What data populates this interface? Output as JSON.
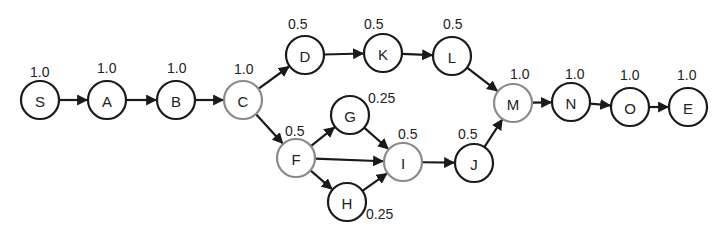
{
  "diagram": {
    "type": "directed-graph",
    "colors": {
      "node_stroke_default": "#1a1a1a",
      "node_stroke_highlight": "#8a8a8a",
      "edge": "#1a1a1a",
      "text": "#222222"
    },
    "nodes": [
      {
        "id": "S",
        "label": "S",
        "weight": "1.0",
        "x": 40,
        "y": 100,
        "highlight": false,
        "wx": 30,
        "wy": 77
      },
      {
        "id": "A",
        "label": "A",
        "weight": "1.0",
        "x": 107,
        "y": 100,
        "highlight": false,
        "wx": 97,
        "wy": 73
      },
      {
        "id": "B",
        "label": "B",
        "weight": "1.0",
        "x": 176,
        "y": 100,
        "highlight": false,
        "wx": 167,
        "wy": 73
      },
      {
        "id": "C",
        "label": "C",
        "weight": "1.0",
        "x": 243,
        "y": 100,
        "highlight": true,
        "wx": 234,
        "wy": 74
      },
      {
        "id": "D",
        "label": "D",
        "weight": "0.5",
        "x": 305,
        "y": 55,
        "highlight": false,
        "wx": 288,
        "wy": 29
      },
      {
        "id": "K",
        "label": "K",
        "weight": "0.5",
        "x": 383,
        "y": 53,
        "highlight": false,
        "wx": 364,
        "wy": 29
      },
      {
        "id": "L",
        "label": "L",
        "weight": "0.5",
        "x": 452,
        "y": 56,
        "highlight": false,
        "wx": 443,
        "wy": 29
      },
      {
        "id": "F",
        "label": "F",
        "weight": "0.5",
        "x": 296,
        "y": 158,
        "highlight": true,
        "wx": 285,
        "wy": 136
      },
      {
        "id": "G",
        "label": "G",
        "weight": "0.25",
        "x": 350,
        "y": 115,
        "highlight": false,
        "wx": 368,
        "wy": 103
      },
      {
        "id": "H",
        "label": "H",
        "weight": "0.25",
        "x": 347,
        "y": 202,
        "highlight": false,
        "wx": 366,
        "wy": 219
      },
      {
        "id": "I",
        "label": "I",
        "weight": "0.5",
        "x": 403,
        "y": 162,
        "highlight": true,
        "wx": 398,
        "wy": 139
      },
      {
        "id": "J",
        "label": "J",
        "weight": "0.5",
        "x": 474,
        "y": 163,
        "highlight": false,
        "wx": 458,
        "wy": 139
      },
      {
        "id": "M",
        "label": "M",
        "weight": "1.0",
        "x": 513,
        "y": 103,
        "highlight": true,
        "wx": 510,
        "wy": 79
      },
      {
        "id": "N",
        "label": "N",
        "weight": "1.0",
        "x": 571,
        "y": 102,
        "highlight": false,
        "wx": 565,
        "wy": 79
      },
      {
        "id": "O",
        "label": "O",
        "weight": "1.0",
        "x": 630,
        "y": 107,
        "highlight": false,
        "wx": 620,
        "wy": 80
      },
      {
        "id": "E",
        "label": "E",
        "weight": "1.0",
        "x": 688,
        "y": 107,
        "highlight": false,
        "wx": 677,
        "wy": 80
      }
    ],
    "radius": 19,
    "edges": [
      [
        "S",
        "A"
      ],
      [
        "A",
        "B"
      ],
      [
        "B",
        "C"
      ],
      [
        "C",
        "D"
      ],
      [
        "D",
        "K"
      ],
      [
        "K",
        "L"
      ],
      [
        "L",
        "M"
      ],
      [
        "C",
        "F"
      ],
      [
        "F",
        "G"
      ],
      [
        "F",
        "I"
      ],
      [
        "F",
        "H"
      ],
      [
        "G",
        "I"
      ],
      [
        "H",
        "I"
      ],
      [
        "I",
        "J"
      ],
      [
        "J",
        "M"
      ],
      [
        "M",
        "N"
      ],
      [
        "N",
        "O"
      ],
      [
        "O",
        "E"
      ]
    ]
  }
}
